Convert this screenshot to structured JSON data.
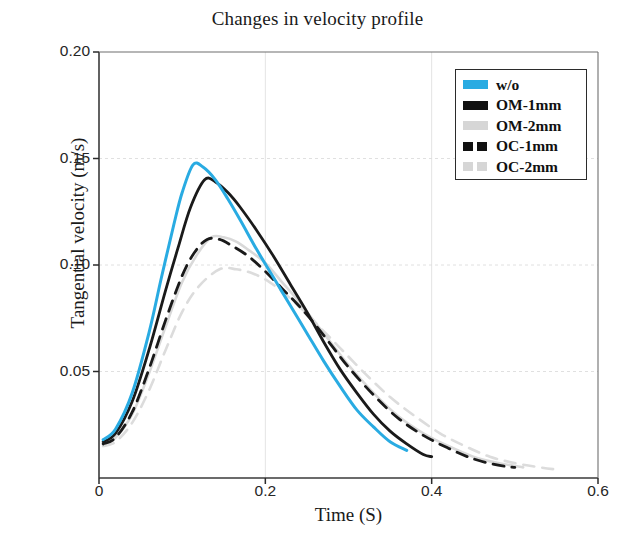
{
  "chart_data": {
    "type": "line",
    "title": "Changes in velocity profile",
    "xlabel": "Time (S)",
    "ylabel": "Tangential velocity (m/s)",
    "xlim": [
      0,
      0.6
    ],
    "ylim": [
      0,
      0.2
    ],
    "xticks": [
      "0",
      "0.2",
      "0.4",
      "0.6"
    ],
    "xtick_values": [
      0,
      0.2,
      0.4,
      0.6
    ],
    "yticks": [
      "0.20",
      "0.15",
      "0.10",
      "0.05"
    ],
    "ytick_values": [
      0.2,
      0.15,
      0.1,
      0.05
    ],
    "grid": true,
    "legend_position": "upper right",
    "series": [
      {
        "name": "w/o",
        "color": "#29abe2",
        "style": "solid",
        "width": 3.0,
        "peak_x": 0.113,
        "peak_y": 0.147,
        "x": [
          0.005,
          0.02,
          0.04,
          0.06,
          0.075,
          0.09,
          0.1,
          0.113,
          0.125,
          0.14,
          0.155,
          0.17,
          0.19,
          0.21,
          0.23,
          0.25,
          0.27,
          0.29,
          0.31,
          0.33,
          0.35,
          0.37
        ],
        "y": [
          0.018,
          0.023,
          0.04,
          0.068,
          0.094,
          0.119,
          0.134,
          0.147,
          0.146,
          0.14,
          0.131,
          0.121,
          0.107,
          0.094,
          0.081,
          0.068,
          0.055,
          0.043,
          0.032,
          0.024,
          0.017,
          0.013
        ]
      },
      {
        "name": "OM-1mm",
        "color": "#1a1a1a",
        "style": "solid",
        "width": 2.8,
        "peak_x": 0.127,
        "peak_y": 0.14,
        "x": [
          0.005,
          0.02,
          0.04,
          0.06,
          0.08,
          0.095,
          0.11,
          0.127,
          0.14,
          0.155,
          0.17,
          0.19,
          0.21,
          0.23,
          0.25,
          0.27,
          0.29,
          0.31,
          0.33,
          0.35,
          0.37,
          0.39,
          0.4
        ],
        "y": [
          0.017,
          0.021,
          0.036,
          0.06,
          0.088,
          0.108,
          0.127,
          0.14,
          0.139,
          0.134,
          0.127,
          0.116,
          0.104,
          0.091,
          0.078,
          0.064,
          0.051,
          0.04,
          0.03,
          0.022,
          0.016,
          0.011,
          0.01
        ]
      },
      {
        "name": "OM-2mm",
        "color": "#d9d9d9",
        "style": "solid",
        "width": 2.6,
        "peak_x": 0.135,
        "peak_y": 0.113,
        "x": [
          0.005,
          0.02,
          0.04,
          0.06,
          0.08,
          0.1,
          0.118,
          0.135,
          0.15,
          0.165,
          0.18,
          0.2,
          0.22,
          0.24,
          0.26,
          0.28,
          0.3,
          0.33,
          0.36,
          0.39,
          0.42,
          0.45,
          0.48,
          0.51
        ],
        "y": [
          0.016,
          0.019,
          0.03,
          0.049,
          0.071,
          0.092,
          0.105,
          0.113,
          0.113,
          0.111,
          0.107,
          0.101,
          0.092,
          0.083,
          0.073,
          0.063,
          0.053,
          0.04,
          0.029,
          0.021,
          0.015,
          0.01,
          0.007,
          0.005
        ]
      },
      {
        "name": "OC-1mm",
        "color": "#1a1a1a",
        "style": "dashed",
        "width": 2.8,
        "peak_x": 0.13,
        "peak_y": 0.112,
        "x": [
          0.005,
          0.02,
          0.04,
          0.06,
          0.08,
          0.1,
          0.115,
          0.13,
          0.145,
          0.16,
          0.18,
          0.2,
          0.22,
          0.24,
          0.26,
          0.28,
          0.3,
          0.33,
          0.36,
          0.39,
          0.42,
          0.45,
          0.48,
          0.5
        ],
        "y": [
          0.016,
          0.019,
          0.031,
          0.051,
          0.074,
          0.095,
          0.106,
          0.112,
          0.112,
          0.109,
          0.104,
          0.097,
          0.089,
          0.081,
          0.072,
          0.062,
          0.052,
          0.039,
          0.028,
          0.02,
          0.014,
          0.009,
          0.006,
          0.005
        ]
      },
      {
        "name": "OC-2mm",
        "color": "#dcdcdc",
        "style": "dashed",
        "width": 2.6,
        "peak_x": 0.145,
        "peak_y": 0.098,
        "x": [
          0.005,
          0.02,
          0.04,
          0.06,
          0.08,
          0.1,
          0.12,
          0.145,
          0.165,
          0.185,
          0.205,
          0.225,
          0.245,
          0.265,
          0.29,
          0.32,
          0.35,
          0.38,
          0.41,
          0.44,
          0.47,
          0.5,
          0.53,
          0.55
        ],
        "y": [
          0.015,
          0.017,
          0.026,
          0.041,
          0.06,
          0.078,
          0.09,
          0.098,
          0.098,
          0.096,
          0.092,
          0.086,
          0.079,
          0.071,
          0.061,
          0.049,
          0.038,
          0.029,
          0.021,
          0.015,
          0.01,
          0.007,
          0.005,
          0.004
        ]
      }
    ]
  },
  "legend": {
    "items": [
      {
        "label": "w/o",
        "color": "#29abe2",
        "style": "solid"
      },
      {
        "label": "OM-1mm",
        "color": "#111111",
        "style": "solid"
      },
      {
        "label": "OM-2mm",
        "color": "#d6d6d6",
        "style": "solid"
      },
      {
        "label": "OC-1mm",
        "color": "#111111",
        "style": "dashed"
      },
      {
        "label": "OC-2mm",
        "color": "#d6d6d6",
        "style": "dashed"
      }
    ]
  }
}
